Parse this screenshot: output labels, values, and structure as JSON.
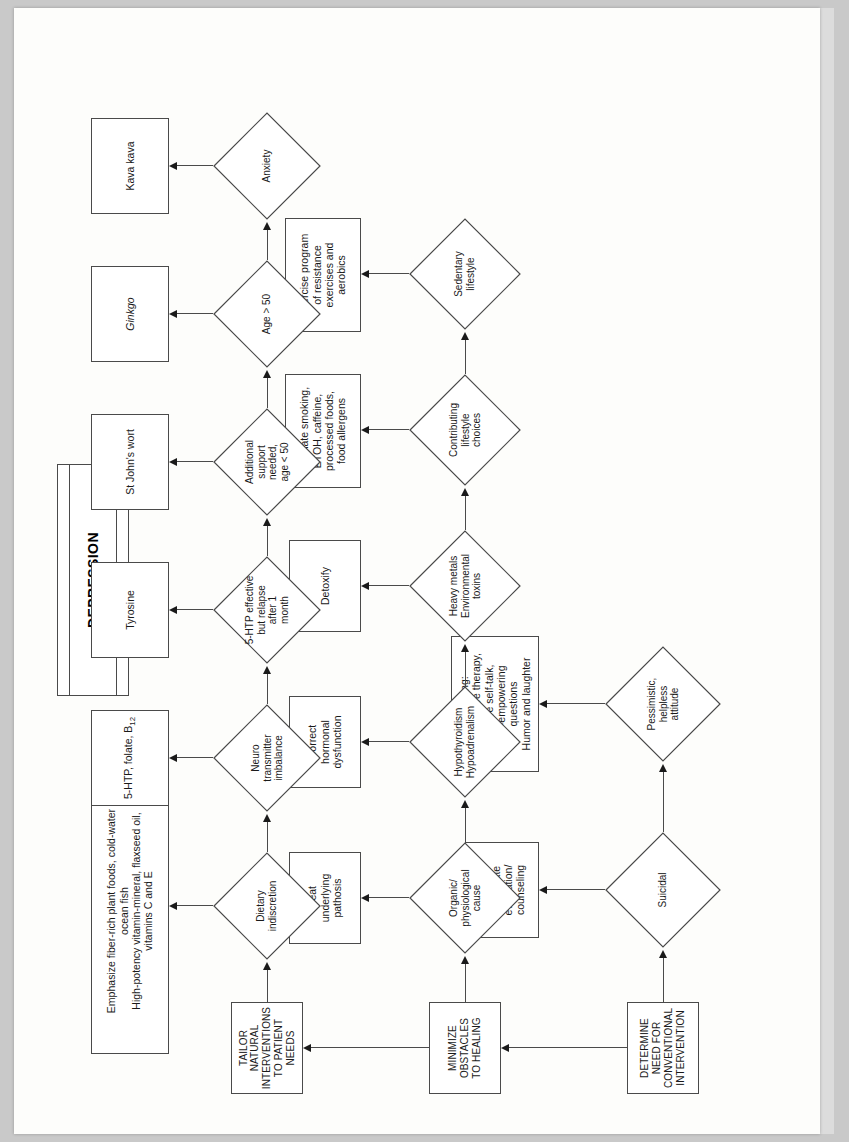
{
  "document": {
    "title": "DEPRESSION",
    "type": "clinical-treatment-flowchart",
    "orientation": "landscape-rotated"
  },
  "title_card": {
    "label": "DEPRESSION"
  },
  "stages": {
    "conventional": {
      "label": "DETERMINE\nNEED FOR\nCONVENTIONAL\nINTERVENTION"
    },
    "obstacles": {
      "label": "MINIMIZE\nOBSTACLES\nTO HEALING"
    },
    "natural": {
      "label": "TAILOR\nNATURAL\nINTERVENTIONS\nTO PATIENT\nNEEDS"
    }
  },
  "row_conventional": {
    "decisions": [
      {
        "id": "suicidal",
        "label": "Suicidal"
      },
      {
        "id": "pessimistic",
        "label": "Pessimistic,\nhelpless\nattitude"
      }
    ],
    "outcomes": [
      {
        "id": "refer",
        "label": "Refer for\nimmediate\nevaluation/\ncounseling"
      },
      {
        "id": "counseling",
        "label": "Counseling:\ne.g. cognitive therapy,\nPositive self-talk,\nself-empowering\nquestions\nHumor and laughter"
      }
    ]
  },
  "row_obstacles": {
    "decisions": [
      {
        "id": "organic",
        "label": "Organic/\nphysiological\ncause"
      },
      {
        "id": "thyroid",
        "label": "Hypothyroidism\nHypoadrenalism"
      },
      {
        "id": "metals",
        "label": "Heavy metals\nEnvironmental\ntoxins"
      },
      {
        "id": "lifestyle",
        "label": "Contributing\nlifestyle\nchoices"
      },
      {
        "id": "sedentary",
        "label": "Sedentary\nlifestyle"
      }
    ],
    "outcomes": [
      {
        "id": "treat-pathosis",
        "label": "Treat\nunderlying\npathosis"
      },
      {
        "id": "correct-hormonal",
        "label": "Correct\nhormonal\ndysfunction"
      },
      {
        "id": "detoxify",
        "label": "Detoxify"
      },
      {
        "id": "eliminate",
        "label": "Eliminate smoking,\nETOH, caffeine,\nprocessed foods,\nfood allergens"
      },
      {
        "id": "exercise",
        "label": "Exercise program\nof resistance\nexercises and\naerobics"
      }
    ]
  },
  "row_natural": {
    "decisions": [
      {
        "id": "dietary",
        "label": "Dietary\nindiscretion"
      },
      {
        "id": "neuro",
        "label": "Neuro\ntransmitter\nimbalance"
      },
      {
        "id": "relapse",
        "label": "5-HTP effective\nbut relapse\nafter 1\nmonth"
      },
      {
        "id": "support",
        "label": "Additional\nsupport\nneeded,\nage < 50"
      },
      {
        "id": "age50",
        "label": "Age > 50"
      },
      {
        "id": "anxiety",
        "label": "Anxiety"
      }
    ],
    "outcomes": [
      {
        "id": "diet-plan",
        "label": "Emphasize fiber-rich plant foods, cold-water\nocean fish\nHigh-potency vitamin-mineral, flaxseed oil,\nvitamins C and E"
      },
      {
        "id": "fivehtp",
        "label_pre": "5-HTP, folate, B",
        "label_sub": "12",
        "label": "5-HTP, folate, B12"
      },
      {
        "id": "tyrosine",
        "label": "Tyrosine"
      },
      {
        "id": "stjohns",
        "label": "St John's wort"
      },
      {
        "id": "ginkgo",
        "label": "Ginkgo",
        "italic": true
      },
      {
        "id": "kava",
        "label": "Kava kava"
      }
    ]
  },
  "colors": {
    "paper": "#fdfdfb",
    "page_background": "#c9c9c9",
    "line": "#4a4a4a",
    "text": "#1a1a1a",
    "node_fill": "#ffffff"
  }
}
